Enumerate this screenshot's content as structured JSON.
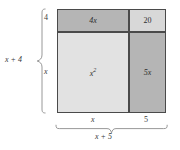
{
  "cells": {
    "top_left": {
      "label": "4x",
      "color": "#b5b5b5"
    },
    "top_right": {
      "label": "20",
      "color": "#d8d8d8"
    },
    "bottom_left": {
      "label": "x",
      "exponent": "2",
      "color": "#e2e2e2"
    },
    "bottom_right": {
      "label": "5x",
      "color": "#b5b5b5"
    }
  },
  "left_axis": {
    "segment_top": "4",
    "segment_bottom": "x",
    "total": "x + 4"
  },
  "bottom_axis": {
    "segment_left": "x",
    "segment_right": "5",
    "total": "x + 5"
  },
  "colors": {
    "outline": "#4a4a4a",
    "brace": "#8c8c8c",
    "text": "#3a3a3a",
    "background": "#ffffff"
  }
}
